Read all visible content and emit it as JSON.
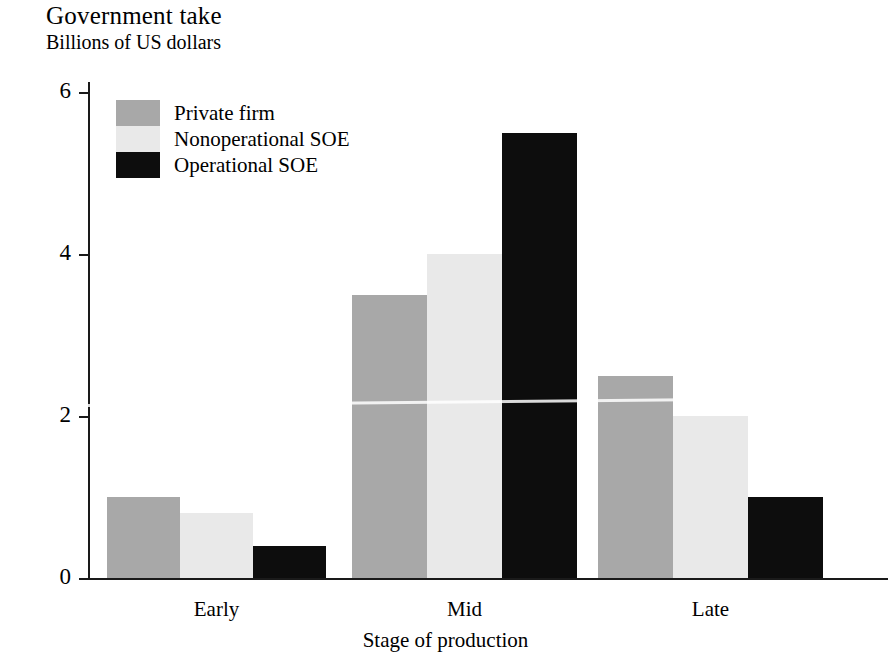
{
  "chart_data": {
    "type": "bar",
    "title": "Government take",
    "subtitle": "Billions of US dollars",
    "xlabel": "Stage of production",
    "ylabel": "",
    "categories": [
      "Early",
      "Mid",
      "Late"
    ],
    "series": [
      {
        "name": "Private firm",
        "color": "#a8a8a8",
        "values": [
          1.0,
          3.5,
          2.5
        ]
      },
      {
        "name": "Nonoperational SOE",
        "color": "#e9e9e9",
        "values": [
          0.8,
          4.0,
          2.0
        ]
      },
      {
        "name": "Operational SOE",
        "color": "#0d0d0d",
        "values": [
          0.4,
          5.5,
          1.0
        ]
      }
    ],
    "ylim": [
      0,
      6
    ],
    "yticks": [
      0,
      2,
      4,
      6
    ],
    "ytick_labels": [
      "0",
      "2",
      "4",
      "6"
    ],
    "grid": false,
    "legend_position": "top-left inside plot",
    "units": "Billions of US dollars"
  },
  "axis": {
    "y_labels": [
      "6",
      "4",
      "2",
      "0"
    ],
    "x_labels": [
      "Early",
      "Mid",
      "Late"
    ],
    "x_title": "Stage of production"
  },
  "legend": {
    "entries": [
      {
        "label": "Private firm"
      },
      {
        "label": "Nonoperational SOE"
      },
      {
        "label": "Operational SOE"
      }
    ]
  },
  "header": {
    "title": "Government take",
    "subtitle": "Billions of US dollars"
  }
}
